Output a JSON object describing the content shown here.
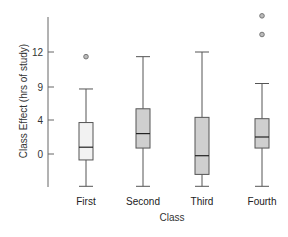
{
  "chart_data": {
    "type": "box",
    "title": "",
    "xlabel": "Class",
    "ylabel": "Class Effect (hrs of study)",
    "y_ticks": [
      {
        "label": "12",
        "px": 52
      },
      {
        "label": "9",
        "px": 87
      },
      {
        "label": "4",
        "px": 120
      },
      {
        "label": "0",
        "px": 154
      }
    ],
    "categories": [
      "First",
      "Second",
      "Third",
      "Fourth"
    ],
    "boxes": [
      {
        "name": "First",
        "min": -3.8,
        "q1": -0.7,
        "median": 0.8,
        "q3": 3.7,
        "max": 8.7,
        "outliers": [
          11.6
        ],
        "fill": "#f2f2f2"
      },
      {
        "name": "Second",
        "min": -3.8,
        "q1": 0.7,
        "median": 2.4,
        "q3": 5.7,
        "max": 11.6,
        "outliers": [],
        "fill": "#cfcfcf"
      },
      {
        "name": "Third",
        "min": -3.8,
        "q1": -2.4,
        "median": -0.2,
        "q3": 4.4,
        "max": 12.0,
        "outliers": [],
        "fill": "#cfcfcf"
      },
      {
        "name": "Fourth",
        "min": -3.8,
        "q1": 0.7,
        "median": 2.0,
        "q3": 4.2,
        "max": 9.3,
        "outliers": [
          13.5,
          15.1
        ],
        "fill": "#cfcfcf"
      }
    ],
    "grid": false,
    "legend": null
  },
  "colors": {
    "axis": "#666666",
    "box_stroke": "#555555",
    "median": "#222222",
    "outlier_stroke": "#777777",
    "outlier_fill": "#bbbbbb"
  }
}
